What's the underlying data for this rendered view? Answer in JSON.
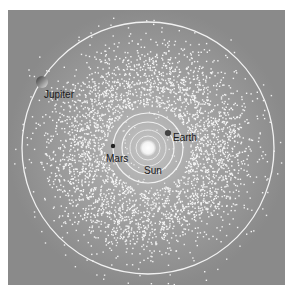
{
  "diagram": {
    "colors": {
      "background": "#8e8e8e",
      "inner_glow": "#b8b8b8",
      "orbit": "#f2f2f2",
      "asteroid": "#f4f4f4",
      "label": "#1a1a1a"
    },
    "bodies": [
      {
        "name": "Sun",
        "label": "Sun"
      },
      {
        "name": "Mars",
        "label": "Mars"
      },
      {
        "name": "Earth",
        "label": "Earth"
      },
      {
        "name": "Jupiter",
        "label": "Jupiter"
      }
    ]
  }
}
